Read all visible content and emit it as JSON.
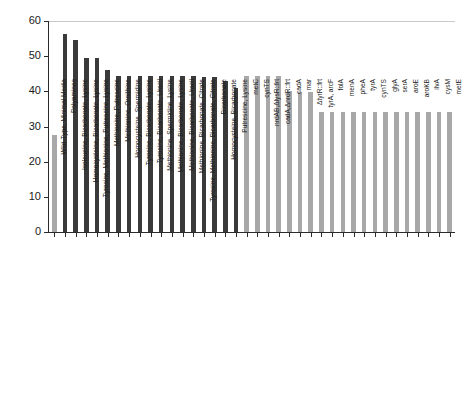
{
  "chart_data": {
    "type": "bar",
    "title": "",
    "xlabel": "",
    "ylabel": "MIC 3-HP (g/L)",
    "ylim": [
      0,
      60
    ],
    "yticks": [
      0,
      10,
      20,
      30,
      40,
      50,
      60
    ],
    "ytick_labels": [
      "0",
      "10",
      "20",
      "30",
      "40",
      "50",
      "60"
    ],
    "grid": false,
    "legend": "none",
    "colors": {
      "dark_bar": "#3a3a3a",
      "light_bar": "#a8a8a8",
      "axis": "#2b2b2b",
      "text": "#1a1a1a"
    },
    "categories": [
      "Wild-Type, Minimal Media",
      "Polyamines",
      "Isoleucine, Bicarbonate, Lysine",
      "Homocysteine, Bicarbonate, Lysine",
      "Tyrosine, Methionine, Putrescine, Lysine",
      "Methionine, Putrescine",
      "Methionine, Ornithine",
      "Homocysteine, Spermidine",
      "Tyrosine, Bicarbonate, Lysine",
      "Tyrosine, Bicarbonate, Uracil",
      "Methionine, Spermidine, Lysine",
      "Methionine, Bicarbonate, Lysine",
      "Methionine, Bicarbonate, Uracil",
      "Methionine, Bicarbonate, Citrate",
      "Tyrosine, Methionine, Bicarbonate, Citrate",
      "Bicarbonate",
      "Homocysteine, Bicarbonate",
      "Putrescine, Lysine",
      "metC",
      "cynTS",
      "nrdAB,ΔlysR::frt",
      "cadA,ΔnrdR::frt",
      "cadA",
      "mar",
      "ΔtyrR::frt",
      "tyrA, arcF",
      "folA",
      "menA",
      "pheA",
      "tyrA",
      "cynTS",
      "glyA",
      "serA",
      "aroE",
      "aroKB",
      "ilvA",
      "cysM",
      "metE"
    ],
    "values": [
      27.5,
      56.2,
      54.6,
      49.6,
      49.6,
      46.2,
      44.4,
      44.4,
      44.4,
      44.4,
      44.3,
      44.3,
      44.3,
      44.3,
      44.2,
      44.1,
      42.9,
      40.9,
      44.4,
      44.4,
      44.4,
      44.4,
      40.0,
      39.7,
      39.7,
      34.2,
      34.2,
      34.2,
      34.2,
      34.2,
      34.2,
      34.2,
      34.2,
      34.2,
      34.2,
      34.2,
      34.2,
      34.2
    ],
    "series_group": [
      "wild-type",
      "media",
      "media",
      "media",
      "media",
      "media",
      "media",
      "media",
      "media",
      "media",
      "media",
      "media",
      "media",
      "media",
      "media",
      "media",
      "media",
      "media",
      "strain",
      "strain",
      "strain",
      "strain",
      "strain",
      "strain",
      "strain",
      "strain",
      "strain",
      "strain",
      "strain",
      "strain",
      "strain",
      "strain",
      "strain",
      "strain",
      "strain",
      "strain",
      "strain",
      "strain"
    ]
  }
}
